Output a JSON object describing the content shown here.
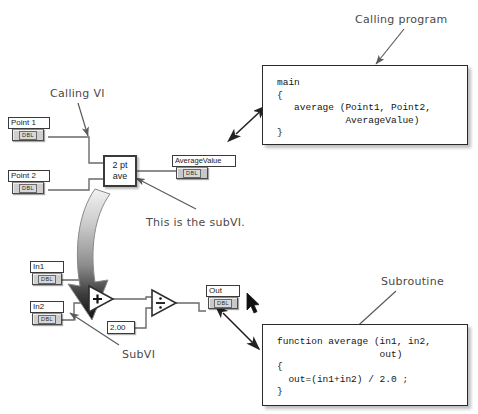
{
  "canvas": {
    "width": 478,
    "height": 414,
    "background": "#ffffff",
    "line_color": "#4a4a4a",
    "ink_color": "#4a4a4a"
  },
  "annotations": {
    "calling_vi": "Calling VI",
    "calling_program": "Calling program",
    "this_is_the_subvi": "This is the subVI.",
    "subvi": "SubVI",
    "subroutine": "Subroutine"
  },
  "calling_diagram": {
    "terminals": [
      {
        "name": "point1",
        "label": "Point 1",
        "type": "DBL",
        "role": "control"
      },
      {
        "name": "point2",
        "label": "Point 2",
        "type": "DBL",
        "role": "control"
      },
      {
        "name": "average_value",
        "label": "AverageValue",
        "type": "DBL",
        "role": "indicator"
      }
    ],
    "node": {
      "line1": "2 pt",
      "line2": "ave"
    }
  },
  "subvi_diagram": {
    "terminals": [
      {
        "name": "in1",
        "label": "In1",
        "type": "DBL",
        "role": "control"
      },
      {
        "name": "in2",
        "label": "In2",
        "type": "DBL",
        "role": "control"
      },
      {
        "name": "out",
        "label": "Out",
        "type": "DBL",
        "role": "indicator"
      }
    ],
    "operators": [
      {
        "name": "add",
        "glyph": "+"
      },
      {
        "name": "divide",
        "glyph": "÷"
      }
    ],
    "constant": "2.00"
  },
  "code": {
    "calling_program": "main\n{\n   average (Point1, Point2,\n            AverageValue)\n}",
    "subroutine": "function average (in1, in2,\n                  out)\n{\n  out=(in1+in2) / 2.0 ;\n}"
  }
}
